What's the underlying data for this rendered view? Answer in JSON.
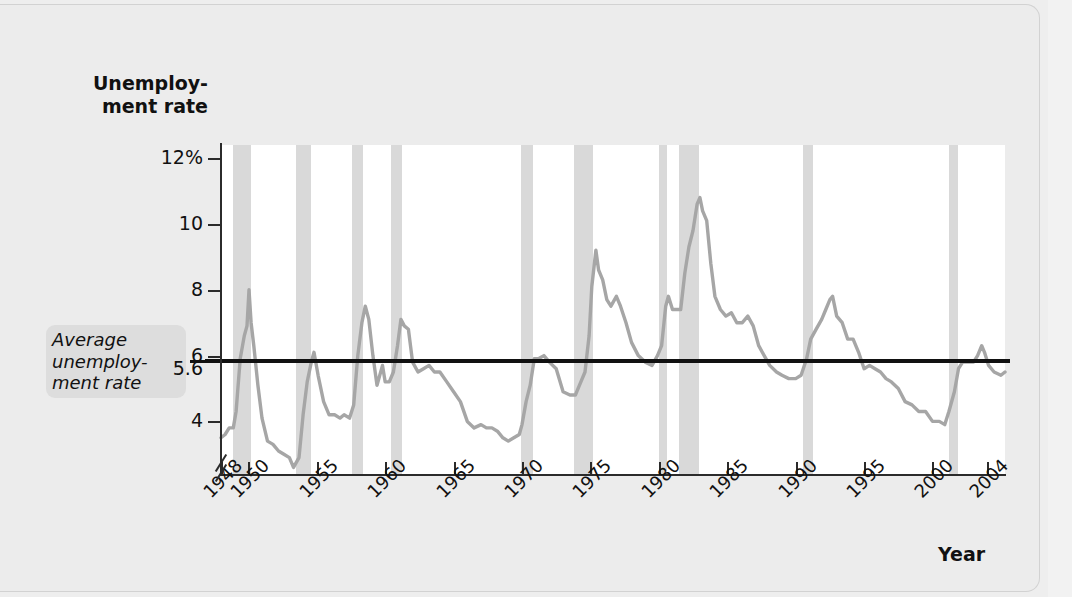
{
  "chart_data": {
    "type": "line",
    "title": "",
    "xlabel": "Year",
    "ylabel": "Unemployment rate",
    "ylim": [
      2.4,
      12.4
    ],
    "xlim": [
      1948,
      2005.3
    ],
    "grid": false,
    "legend": "none",
    "y_ticks": [
      {
        "value": 12,
        "label": "12%"
      },
      {
        "value": 10,
        "label": "10"
      },
      {
        "value": 8,
        "label": "8"
      },
      {
        "value": 6,
        "label": "6"
      },
      {
        "value": 5.6,
        "label": "5.6"
      },
      {
        "value": 4,
        "label": "4"
      }
    ],
    "x_ticks": [
      {
        "value": 1948,
        "label": "1948"
      },
      {
        "value": 1950,
        "label": "1950"
      },
      {
        "value": 1955,
        "label": "1955"
      },
      {
        "value": 1960,
        "label": "1960"
      },
      {
        "value": 1965,
        "label": "1965"
      },
      {
        "value": 1970,
        "label": "1970"
      },
      {
        "value": 1975,
        "label": "1975"
      },
      {
        "value": 1980,
        "label": "1980"
      },
      {
        "value": 1985,
        "label": "1985"
      },
      {
        "value": 1990,
        "label": "1990"
      },
      {
        "value": 1995,
        "label": "1995"
      },
      {
        "value": 2000,
        "label": "2000"
      },
      {
        "value": 2004,
        "label": "2004"
      }
    ],
    "annotations": [
      {
        "name": "average-unemployment-rate",
        "text": "Average unemploy- ment rate",
        "value": 5.6,
        "style": "horizontal black reference line"
      }
    ],
    "recession_bands": {
      "label": "recession",
      "color": "#d9d9d9",
      "spans": [
        [
          1948.9,
          1950.2
        ],
        [
          1953.5,
          1954.6
        ],
        [
          1957.6,
          1958.4
        ],
        [
          1960.4,
          1961.2
        ],
        [
          1969.9,
          1970.8
        ],
        [
          1973.8,
          1975.2
        ],
        [
          1980.0,
          1980.6
        ],
        [
          1981.5,
          1982.9
        ],
        [
          1990.5,
          1991.3
        ],
        [
          2001.2,
          2001.9
        ]
      ]
    },
    "series": [
      {
        "name": "Unemployment rate",
        "color": "#a6a6a6",
        "units": "percent",
        "points": [
          [
            1948.0,
            3.5
          ],
          [
            1948.3,
            3.6
          ],
          [
            1948.6,
            3.8
          ],
          [
            1948.9,
            3.8
          ],
          [
            1949.1,
            4.3
          ],
          [
            1949.4,
            5.9
          ],
          [
            1949.7,
            6.6
          ],
          [
            1949.9,
            6.9
          ],
          [
            1950.05,
            8.0
          ],
          [
            1950.2,
            7.0
          ],
          [
            1950.4,
            6.3
          ],
          [
            1950.7,
            5.1
          ],
          [
            1951.0,
            4.1
          ],
          [
            1951.4,
            3.4
          ],
          [
            1951.8,
            3.3
          ],
          [
            1952.2,
            3.1
          ],
          [
            1952.6,
            3.0
          ],
          [
            1953.0,
            2.9
          ],
          [
            1953.3,
            2.6
          ],
          [
            1953.7,
            2.9
          ],
          [
            1954.0,
            4.2
          ],
          [
            1954.3,
            5.2
          ],
          [
            1954.6,
            5.8
          ],
          [
            1954.8,
            6.1
          ],
          [
            1955.1,
            5.4
          ],
          [
            1955.5,
            4.6
          ],
          [
            1955.9,
            4.2
          ],
          [
            1956.3,
            4.2
          ],
          [
            1956.7,
            4.1
          ],
          [
            1957.0,
            4.2
          ],
          [
            1957.4,
            4.1
          ],
          [
            1957.7,
            4.5
          ],
          [
            1958.0,
            6.0
          ],
          [
            1958.3,
            7.0
          ],
          [
            1958.55,
            7.5
          ],
          [
            1958.8,
            7.1
          ],
          [
            1959.1,
            6.0
          ],
          [
            1959.4,
            5.1
          ],
          [
            1959.8,
            5.7
          ],
          [
            1960.0,
            5.2
          ],
          [
            1960.3,
            5.2
          ],
          [
            1960.6,
            5.5
          ],
          [
            1960.9,
            6.3
          ],
          [
            1961.15,
            7.1
          ],
          [
            1961.4,
            6.9
          ],
          [
            1961.7,
            6.8
          ],
          [
            1962.0,
            5.8
          ],
          [
            1962.4,
            5.5
          ],
          [
            1962.8,
            5.6
          ],
          [
            1963.2,
            5.7
          ],
          [
            1963.6,
            5.5
          ],
          [
            1964.0,
            5.5
          ],
          [
            1964.5,
            5.2
          ],
          [
            1965.0,
            4.9
          ],
          [
            1965.5,
            4.6
          ],
          [
            1966.0,
            4.0
          ],
          [
            1966.5,
            3.8
          ],
          [
            1967.0,
            3.9
          ],
          [
            1967.4,
            3.8
          ],
          [
            1967.8,
            3.8
          ],
          [
            1968.2,
            3.7
          ],
          [
            1968.6,
            3.5
          ],
          [
            1969.0,
            3.4
          ],
          [
            1969.4,
            3.5
          ],
          [
            1969.8,
            3.6
          ],
          [
            1970.0,
            3.9
          ],
          [
            1970.3,
            4.6
          ],
          [
            1970.6,
            5.1
          ],
          [
            1970.9,
            5.9
          ],
          [
            1971.2,
            5.9
          ],
          [
            1971.6,
            6.0
          ],
          [
            1972.0,
            5.8
          ],
          [
            1972.5,
            5.6
          ],
          [
            1973.0,
            4.9
          ],
          [
            1973.5,
            4.8
          ],
          [
            1973.9,
            4.8
          ],
          [
            1974.2,
            5.1
          ],
          [
            1974.6,
            5.5
          ],
          [
            1974.9,
            6.6
          ],
          [
            1975.1,
            8.1
          ],
          [
            1975.4,
            9.2
          ],
          [
            1975.6,
            8.6
          ],
          [
            1975.9,
            8.3
          ],
          [
            1976.2,
            7.7
          ],
          [
            1976.5,
            7.5
          ],
          [
            1976.9,
            7.8
          ],
          [
            1977.2,
            7.5
          ],
          [
            1977.6,
            7.0
          ],
          [
            1978.0,
            6.4
          ],
          [
            1978.5,
            6.0
          ],
          [
            1979.0,
            5.8
          ],
          [
            1979.5,
            5.7
          ],
          [
            1979.9,
            6.0
          ],
          [
            1980.2,
            6.3
          ],
          [
            1980.5,
            7.5
          ],
          [
            1980.7,
            7.8
          ],
          [
            1981.0,
            7.4
          ],
          [
            1981.3,
            7.4
          ],
          [
            1981.6,
            7.4
          ],
          [
            1981.9,
            8.5
          ],
          [
            1982.2,
            9.3
          ],
          [
            1982.5,
            9.8
          ],
          [
            1982.8,
            10.6
          ],
          [
            1983.0,
            10.8
          ],
          [
            1983.2,
            10.4
          ],
          [
            1983.5,
            10.1
          ],
          [
            1983.8,
            8.8
          ],
          [
            1984.1,
            7.8
          ],
          [
            1984.5,
            7.4
          ],
          [
            1984.9,
            7.2
          ],
          [
            1985.3,
            7.3
          ],
          [
            1985.7,
            7.0
          ],
          [
            1986.1,
            7.0
          ],
          [
            1986.5,
            7.2
          ],
          [
            1986.9,
            6.9
          ],
          [
            1987.3,
            6.3
          ],
          [
            1987.7,
            6.0
          ],
          [
            1988.1,
            5.7
          ],
          [
            1988.6,
            5.5
          ],
          [
            1989.0,
            5.4
          ],
          [
            1989.5,
            5.3
          ],
          [
            1990.0,
            5.3
          ],
          [
            1990.4,
            5.4
          ],
          [
            1990.8,
            5.9
          ],
          [
            1991.1,
            6.5
          ],
          [
            1991.5,
            6.8
          ],
          [
            1991.9,
            7.1
          ],
          [
            1992.2,
            7.4
          ],
          [
            1992.5,
            7.7
          ],
          [
            1992.7,
            7.8
          ],
          [
            1993.0,
            7.2
          ],
          [
            1993.4,
            7.0
          ],
          [
            1993.8,
            6.5
          ],
          [
            1994.2,
            6.5
          ],
          [
            1994.6,
            6.1
          ],
          [
            1995.0,
            5.6
          ],
          [
            1995.4,
            5.7
          ],
          [
            1995.8,
            5.6
          ],
          [
            1996.2,
            5.5
          ],
          [
            1996.6,
            5.3
          ],
          [
            1997.0,
            5.2
          ],
          [
            1997.5,
            5.0
          ],
          [
            1998.0,
            4.6
          ],
          [
            1998.5,
            4.5
          ],
          [
            1999.0,
            4.3
          ],
          [
            1999.5,
            4.3
          ],
          [
            2000.0,
            4.0
          ],
          [
            2000.5,
            4.0
          ],
          [
            2000.9,
            3.9
          ],
          [
            2001.2,
            4.3
          ],
          [
            2001.6,
            4.9
          ],
          [
            2001.9,
            5.6
          ],
          [
            2002.2,
            5.8
          ],
          [
            2002.6,
            5.8
          ],
          [
            2003.0,
            5.8
          ],
          [
            2003.3,
            6.0
          ],
          [
            2003.6,
            6.3
          ],
          [
            2003.8,
            6.1
          ],
          [
            2004.1,
            5.7
          ],
          [
            2004.5,
            5.5
          ],
          [
            2005.0,
            5.4
          ],
          [
            2005.3,
            5.5
          ]
        ]
      }
    ]
  },
  "axis": {
    "y_title_line1": "Unemploy-",
    "y_title_line2": "ment rate",
    "x_title": "Year"
  },
  "callout": {
    "line1": "Average",
    "line2": "unemploy-",
    "line3": "ment rate"
  },
  "colors": {
    "series_line": "#a6a6a6",
    "average_line": "#111111",
    "recession_band": "#d9d9d9",
    "plot_background": "#ffffff",
    "page_background": "#ececec"
  }
}
